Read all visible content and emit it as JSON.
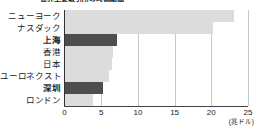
{
  "chart_data": {
    "type": "bar",
    "orientation": "horizontal",
    "title": "世界主要取引所の時価総額",
    "categories": [
      "ニューヨーク",
      "ナスダック",
      "上海",
      "香港",
      "日本",
      "ユーロネクスト",
      "深圳",
      "ロンドン"
    ],
    "values": [
      23.1,
      20.2,
      7.2,
      6.6,
      6.5,
      6.1,
      5.3,
      3.9
    ],
    "highlighted": [
      false,
      false,
      true,
      false,
      false,
      false,
      true,
      false
    ],
    "xlabel": "",
    "ylabel": "",
    "unit": "(兆ドル)",
    "xlim": [
      0,
      25
    ],
    "xticks": [
      0,
      5,
      10,
      15,
      20,
      25
    ],
    "xtick_labels": [
      "0",
      "5",
      "10",
      "15",
      "20",
      "25"
    ],
    "grid": true,
    "legend": false,
    "colors": {
      "bar_default": "#dcdcdc",
      "bar_highlight": "#4d4d4d",
      "gridline": "#c8c8c8",
      "axis": "#333333",
      "text": "#1a1a1a"
    }
  }
}
